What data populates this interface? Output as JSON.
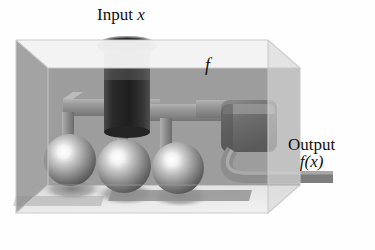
{
  "figure": {
    "title_visible": false,
    "background_color": "#fefefe",
    "labels": {
      "input": {
        "text": "Input",
        "variable": "x"
      },
      "function": {
        "text": "f"
      },
      "output": {
        "line1": "Output",
        "line2": "f(x)"
      }
    },
    "palette": {
      "label_text": "#111111",
      "box_top_face": "#f2f2f2",
      "box_back_wall": "#9d9d9d",
      "box_left_face": "#8f8f8f",
      "box_right_face": "#d5d5d5",
      "box_floor": "#e8e8e8",
      "box_edge": "#b5b5b5",
      "pipe_light": "#a8a8a8",
      "pipe_mid": "#8d8d8d",
      "pipe_dark": "#6f6f6f",
      "cylinder_dark": "#2a2a2a",
      "cylinder_rim": "#3a3a3a",
      "cube_face": "#6a6a6a",
      "cube_top": "#8a8a8a",
      "sphere_highlight": "#ffffff",
      "sphere_body": "#9a9a9a",
      "sphere_dark": "#4a4a4a",
      "shadow": "#8a8a8a"
    },
    "objects": [
      {
        "name": "transparent-box",
        "kind": "box",
        "note": "open glass enclosure in isometric view"
      },
      {
        "name": "input-funnel",
        "kind": "cylinder",
        "note": "dark cylinder with flared rim entering from top"
      },
      {
        "name": "sphere-1",
        "kind": "sphere",
        "cx": 70,
        "cy": 160,
        "r": 26
      },
      {
        "name": "sphere-2",
        "kind": "sphere",
        "cx": 124,
        "cy": 166,
        "r": 27
      },
      {
        "name": "sphere-3",
        "kind": "sphere",
        "cx": 178,
        "cy": 168,
        "r": 26
      },
      {
        "name": "processing-cube",
        "kind": "cube",
        "note": "rounded dark cube on right side"
      },
      {
        "name": "output-pipe",
        "kind": "pipe",
        "note": "curved pipe exiting right wall"
      }
    ]
  }
}
